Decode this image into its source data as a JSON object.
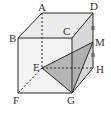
{
  "figure": {
    "type": "cube-geometry",
    "labels": {
      "A": "A",
      "B": "B",
      "C": "C",
      "D": "D",
      "E": "E",
      "F": "F",
      "G": "G",
      "H": "H",
      "M": "M"
    },
    "edges_solid": [
      [
        "A",
        "D"
      ],
      [
        "A",
        "B"
      ],
      [
        "B",
        "C"
      ],
      [
        "C",
        "D"
      ],
      [
        "B",
        "F"
      ],
      [
        "F",
        "G"
      ],
      [
        "C",
        "G"
      ],
      [
        "D",
        "H"
      ],
      [
        "G",
        "H"
      ],
      [
        "E",
        "M"
      ],
      [
        "M",
        "G"
      ]
    ],
    "edges_dashed": [
      [
        "A",
        "E"
      ],
      [
        "E",
        "F"
      ],
      [
        "E",
        "H"
      ]
    ],
    "edges_solid_extra": [
      [
        "E",
        "G"
      ]
    ],
    "shaded_triangle": [
      "E",
      "G",
      "M"
    ],
    "equal_marks": [
      [
        "D",
        "M"
      ],
      [
        "M",
        "H"
      ]
    ],
    "colors": {
      "line": "#2a2a2a",
      "shade_triangle": "#a8a8a8",
      "shade_right_face": "#d6d6d6",
      "shade_top_face": "#e8e8e8",
      "shade_front_face": "#f0f0f0"
    }
  }
}
